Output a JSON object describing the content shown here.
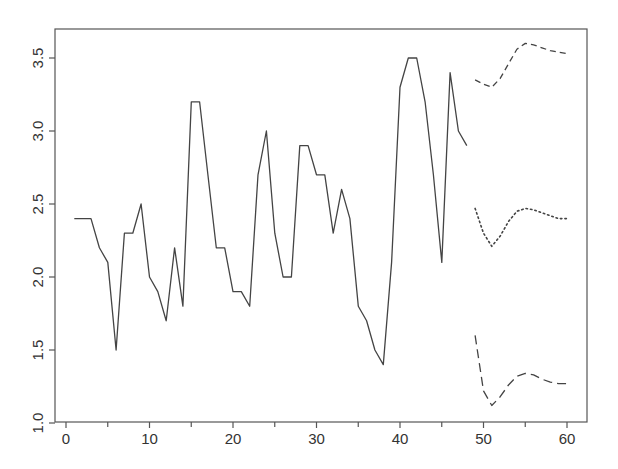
{
  "chart_data": {
    "type": "line",
    "title": "",
    "xlabel": "",
    "ylabel": "",
    "xlim": [
      0,
      60
    ],
    "ylim": [
      1.0,
      3.6
    ],
    "grid": false,
    "legend": null,
    "x_ticks": [
      0,
      10,
      20,
      30,
      40,
      50,
      60
    ],
    "x_minor_ticks": [
      5,
      15,
      25,
      35,
      45,
      55
    ],
    "y_ticks": [
      1.0,
      1.5,
      2.0,
      2.5,
      3.0,
      3.5
    ],
    "x_tick_labels": [
      "0",
      "10",
      "20",
      "30",
      "40",
      "50",
      "60"
    ],
    "y_tick_labels": [
      "1.0",
      "1.5",
      "2.0",
      "2.5",
      "3.0",
      "3.5"
    ],
    "series": [
      {
        "name": "observed",
        "style": "solid",
        "x": [
          1,
          2,
          3,
          4,
          5,
          6,
          7,
          8,
          9,
          10,
          11,
          12,
          13,
          14,
          15,
          16,
          17,
          18,
          19,
          20,
          21,
          22,
          23,
          24,
          25,
          26,
          27,
          28,
          29,
          30,
          31,
          32,
          33,
          34,
          35,
          36,
          37,
          38,
          39,
          40,
          41,
          42,
          43,
          44,
          45,
          46,
          47,
          48
        ],
        "values": [
          2.4,
          2.4,
          2.4,
          2.2,
          2.1,
          1.5,
          2.3,
          2.3,
          2.5,
          2.0,
          1.9,
          1.7,
          2.2,
          1.8,
          3.2,
          3.2,
          2.7,
          2.2,
          2.2,
          1.9,
          1.9,
          1.8,
          2.7,
          3.0,
          2.3,
          2.0,
          2.0,
          2.9,
          2.9,
          2.7,
          2.7,
          2.3,
          2.6,
          2.4,
          1.8,
          1.7,
          1.5,
          1.4,
          2.1,
          3.3,
          3.5,
          3.5,
          3.2,
          2.7,
          2.1,
          3.4,
          3.0,
          2.9
        ]
      },
      {
        "name": "forecast upper bound",
        "style": "dashed",
        "x": [
          49,
          50,
          51,
          52,
          53,
          54,
          55,
          56,
          57,
          58,
          59,
          60
        ],
        "values": [
          3.35,
          3.32,
          3.3,
          3.36,
          3.46,
          3.56,
          3.6,
          3.59,
          3.57,
          3.55,
          3.54,
          3.53
        ]
      },
      {
        "name": "forecast",
        "style": "dotted",
        "x": [
          49,
          50,
          51,
          52,
          53,
          54,
          55,
          56,
          57,
          58,
          59,
          60
        ],
        "values": [
          2.47,
          2.3,
          2.21,
          2.28,
          2.38,
          2.45,
          2.47,
          2.46,
          2.44,
          2.42,
          2.4,
          2.4
        ]
      },
      {
        "name": "forecast lower bound",
        "style": "longdash",
        "x": [
          49,
          50,
          51,
          52,
          53,
          54,
          55,
          56,
          57,
          58,
          59,
          60
        ],
        "values": [
          1.6,
          1.22,
          1.12,
          1.18,
          1.26,
          1.32,
          1.34,
          1.33,
          1.3,
          1.28,
          1.27,
          1.27
        ]
      }
    ]
  },
  "plot": {
    "frame": {
      "left": 55,
      "top": 29,
      "right": 587,
      "bottom": 422
    },
    "x_origin_px": 66,
    "x_px_per_unit": 8.35,
    "y_px_at_1": 423,
    "y_px_per_unit": 146,
    "line_color": "#444444",
    "axis_color": "#555555"
  }
}
